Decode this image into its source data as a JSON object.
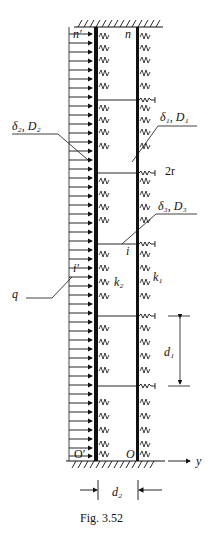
{
  "figure": {
    "caption": "Fig. 3.52",
    "labels": {
      "n_prime": "n′",
      "n": "n",
      "delta2_D2": "δ₂, D₂",
      "delta1_D1": "δ₁, D₁",
      "two_r": "2r",
      "delta3_D3": "δ₃, D₃",
      "i": "i",
      "i_prime": "i′",
      "q": "q",
      "k2": "k₂",
      "k1": "k₁",
      "d1": "d₁",
      "O_prime": "O′",
      "O": "O",
      "y": "y",
      "d2": "d₂"
    }
  }
}
